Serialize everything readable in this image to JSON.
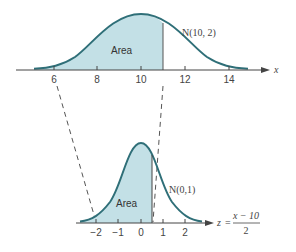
{
  "diagram": {
    "colors": {
      "curve": "#2f6f78",
      "fill": "#c3e0e6",
      "axis": "#444444",
      "dashed": "#555555",
      "text": "#444444"
    },
    "top_plot": {
      "distribution_label": "N(10, 2)",
      "distribution_letter": "N",
      "distribution_params": "(10, 2)",
      "area_label": "Area",
      "axis_variable": "x",
      "mean": 10,
      "sd": 2,
      "cutoff": 11,
      "tick_labels": [
        "6",
        "8",
        "10",
        "12",
        "14"
      ]
    },
    "bottom_plot": {
      "distribution_label": "N(0,1)",
      "distribution_letter": "N",
      "distribution_params": "(0,1)",
      "area_label": "Area",
      "axis_variable": "z",
      "equals": "=",
      "formula_numerator": "x − 10",
      "formula_denominator": "2",
      "mean": 0,
      "sd": 1,
      "cutoff": 0.5,
      "tick_labels": [
        "−2",
        "−1",
        "0",
        "1",
        "2"
      ]
    },
    "mapping_lines": [
      {
        "from": "6",
        "to": "−2"
      },
      {
        "from": "11",
        "to": "0.5"
      }
    ]
  }
}
